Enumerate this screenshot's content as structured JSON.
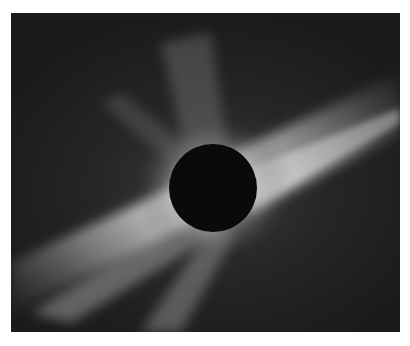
{
  "image": {
    "subject": "total solar eclipse corona",
    "alt": "Black disk of the moon surrounded by bright white coronal streamers against a dark sky",
    "colors": {
      "background_frame": "#ffffff",
      "sky": "#1e1e1e",
      "corona": "#f2f2f2",
      "moon_disk": "#0a0a0a"
    },
    "moon": {
      "cx": 202,
      "cy": 175,
      "r": 44
    }
  }
}
